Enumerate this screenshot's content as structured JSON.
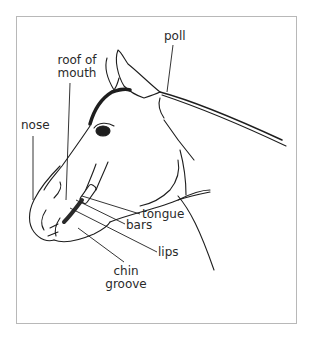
{
  "figure": {
    "labels": {
      "poll": "poll",
      "roof_of_mouth_line1": "roof of",
      "roof_of_mouth_line2": "mouth",
      "nose": "nose",
      "tongue": "tongue",
      "bars": "bars",
      "lips": "lips",
      "chin_groove_line1": "chin",
      "chin_groove_line2": "groove"
    },
    "caption_truncated": ""
  },
  "colors": {
    "line": "#1e1e1e",
    "frame": "#b8b8b8",
    "label": "#2a2a2a"
  }
}
